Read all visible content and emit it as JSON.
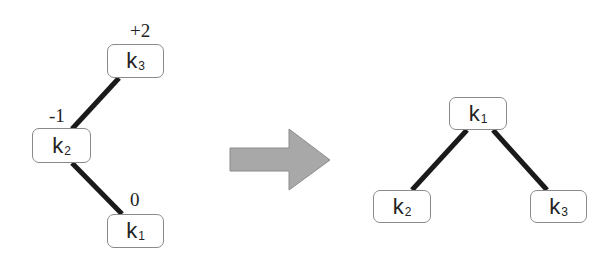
{
  "left_tree": {
    "nodes": [
      {
        "id": "k3",
        "label": "k",
        "sub": "3",
        "balance": "+2"
      },
      {
        "id": "k2",
        "label": "k",
        "sub": "2",
        "balance": "-1"
      },
      {
        "id": "k1",
        "label": "k",
        "sub": "1",
        "balance": "0"
      }
    ],
    "edges": [
      [
        "k3",
        "k2"
      ],
      [
        "k2",
        "k1"
      ]
    ]
  },
  "arrow": {
    "color": "#a8a8a8",
    "icon": "right-arrow-icon"
  },
  "right_tree": {
    "nodes": [
      {
        "id": "k1",
        "label": "k",
        "sub": "1"
      },
      {
        "id": "k2",
        "label": "k",
        "sub": "2"
      },
      {
        "id": "k3",
        "label": "k",
        "sub": "3"
      }
    ],
    "edges": [
      [
        "k1",
        "k2"
      ],
      [
        "k1",
        "k3"
      ]
    ]
  }
}
